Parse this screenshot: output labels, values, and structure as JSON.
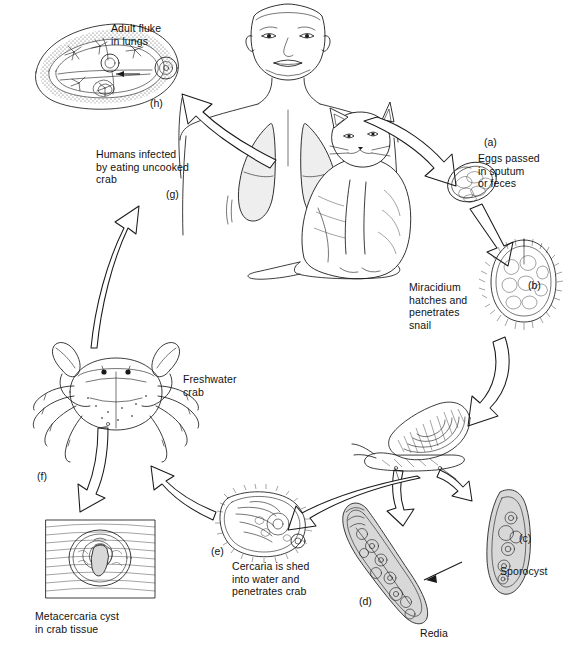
{
  "figure": {
    "background_color": "#ffffff",
    "line_color": "#1a1a1a",
    "type": "life-cycle-diagram"
  },
  "labels": {
    "adult_fluke": "Adult fluke\nin lungs",
    "adult_fluke_tag": "(h)",
    "humans_infected": "Humans infected\nby eating uncooked\ncrab",
    "humans_infected_tag": "(g)",
    "eggs_tag": "(a)",
    "eggs": "Eggs passed\nin sputum\nor feces",
    "miracidium": "Miracidium\nhatches and\npenetrates\nsnail",
    "miracidium_tag": "(b)",
    "sporocyst_tag": "(c)",
    "sporocyst": "Sporocyst",
    "redia_tag": "(d)",
    "redia": "Redia",
    "cercaria_tag": "(e)",
    "cercaria": "Cercaria is shed\ninto water and\npenetrates crab",
    "crab": "Freshwater\ncrab",
    "crab_tag": "(f)",
    "metacercaria": "Metacercaria cyst\nin crab tissue"
  },
  "stages": [
    {
      "id": "a",
      "name": "eggs",
      "label": "Eggs passed in sputum or feces"
    },
    {
      "id": "b",
      "name": "miracidium",
      "label": "Miracidium hatches and penetrates snail"
    },
    {
      "id": "c",
      "name": "sporocyst",
      "label": "Sporocyst"
    },
    {
      "id": "d",
      "name": "redia",
      "label": "Redia"
    },
    {
      "id": "e",
      "name": "cercaria",
      "label": "Cercaria is shed into water and penetrates crab"
    },
    {
      "id": "f",
      "name": "crab",
      "label": "Freshwater crab"
    },
    {
      "id": "g",
      "name": "human-infect",
      "label": "Humans infected by eating uncooked crab"
    },
    {
      "id": "h",
      "name": "adult-fluke",
      "label": "Adult fluke in lungs"
    }
  ],
  "illustrations": {
    "adult_fluke": "adult-fluke-drawing",
    "human": "human-torso-drawing",
    "lungs": "lungs-drawing",
    "cat": "cat-drawing",
    "egg": "egg-drawing",
    "miracidium": "miracidium-drawing",
    "snail": "snail-drawing",
    "sporocyst": "sporocyst-drawing",
    "redia": "redia-drawing",
    "cercaria": "cercaria-drawing",
    "crab": "crab-drawing",
    "metacercaria_cyst": "metacercaria-cyst-drawing"
  }
}
